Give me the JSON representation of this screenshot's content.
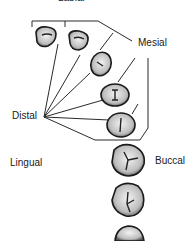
{
  "figure": {
    "labels": {
      "top": "Labial",
      "mesial": "Mesial",
      "distal": "Distal",
      "lingual": "Lingual",
      "buccal": "Buccal"
    },
    "teeth": [
      {
        "name": "central-incisor"
      },
      {
        "name": "lateral-incisor"
      },
      {
        "name": "canine"
      },
      {
        "name": "first-premolar"
      },
      {
        "name": "second-premolar"
      },
      {
        "name": "first-molar"
      },
      {
        "name": "second-molar"
      },
      {
        "name": "third-molar"
      }
    ],
    "colors": {
      "ink": "#1a1a1a",
      "fill": "#d8d8d8",
      "background": "#ffffff"
    }
  }
}
